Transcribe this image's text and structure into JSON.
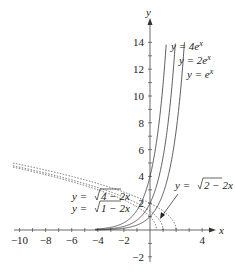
{
  "chart_data": {
    "type": "line",
    "title": "",
    "xlabel": "x",
    "ylabel": "y",
    "xlim": [
      -10.5,
      5
    ],
    "ylim": [
      -3,
      15
    ],
    "x_ticks": [
      -10,
      -8,
      -6,
      -4,
      -2,
      4
    ],
    "y_ticks": [
      -2,
      2,
      4,
      6,
      8,
      10,
      12,
      14
    ],
    "grid": false,
    "legend": "none",
    "series": [
      {
        "name": "y = 4e^x",
        "style": "solid",
        "formula": "4*exp(x)"
      },
      {
        "name": "y = 2e^x",
        "style": "solid",
        "formula": "2*exp(x)"
      },
      {
        "name": "y = e^x",
        "style": "solid",
        "formula": "exp(x)"
      },
      {
        "name": "y = sqrt(4 - 2x)",
        "style": "dotted",
        "formula": "sqrt(4-2x)"
      },
      {
        "name": "y = sqrt(2 - 2x)",
        "style": "dotted",
        "formula": "sqrt(2-2x)"
      },
      {
        "name": "y = sqrt(1 - 2x)",
        "style": "dotted",
        "formula": "sqrt(1-2x)"
      }
    ],
    "annotations": [
      {
        "text": "y = 4e^x"
      },
      {
        "text": "y = 2e^x"
      },
      {
        "text": "y = e^x"
      },
      {
        "text": "y = √(4 − 2x)"
      },
      {
        "text": "y = √(1 − 2x)"
      },
      {
        "text": "y = √(2 − 2x)",
        "arrow": true
      }
    ]
  },
  "labels": {
    "x_axis": "x",
    "y_axis": "y",
    "ticks_x": [
      "−10",
      "−8",
      "−6",
      "−4",
      "−2",
      "4"
    ],
    "ticks_y": [
      "14",
      "12",
      "10",
      "8",
      "6",
      "4",
      "2",
      "−2"
    ],
    "ann_4ex_pre": "y = 4e",
    "ann_2ex_pre": "y = 2e",
    "ann_ex_pre": "y = e",
    "sup_x": "x",
    "ann_sqrt4_pre": "y = ",
    "ann_sqrt4_body": "4 − 2x",
    "ann_sqrt1_pre": "y = ",
    "ann_sqrt1_body": "1 − 2x",
    "ann_sqrt2_pre": "y = ",
    "ann_sqrt2_body": "2 − 2x"
  }
}
